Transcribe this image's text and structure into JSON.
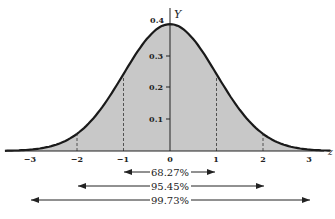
{
  "chart_data": {
    "type": "area",
    "title": "",
    "xlabel": "z",
    "ylabel": "Y",
    "xlim": [
      -3.3,
      3.3
    ],
    "ylim": [
      0,
      0.4
    ],
    "grid": false,
    "x_ticks": [
      "-3",
      "-2",
      "-1",
      "0",
      "1",
      "2",
      "3"
    ],
    "y_ticks": [
      "0.1",
      "0.2",
      "0.3",
      "0.4"
    ],
    "curve": "standard normal density Y = (1/sqrt(2*pi)) * exp(-z^2/2)",
    "series": [
      {
        "name": "Standard normal curve",
        "x": [
          -3,
          -2,
          -1,
          0,
          1,
          2,
          3
        ],
        "values": [
          0.0044,
          0.054,
          0.242,
          0.399,
          0.242,
          0.054,
          0.0044
        ]
      }
    ],
    "dashed_lines_at": [
      -2,
      -1,
      1,
      2
    ],
    "annotations": [
      {
        "label": "68.27%",
        "from": -1,
        "to": 1
      },
      {
        "label": "95.45%",
        "from": -2,
        "to": 2
      },
      {
        "label": "99.73%",
        "from": -3,
        "to": 3
      }
    ]
  },
  "labels": {
    "y_axis": "Y",
    "x_axis": "z",
    "xt": [
      "−3",
      "−2",
      "−1",
      "0",
      "1",
      "2",
      "3"
    ],
    "yt": [
      "0.1",
      "0.2",
      "0.3",
      "0.4"
    ],
    "p68": "68.27%",
    "p95": "95.45%",
    "p99": "99.73%"
  },
  "colors": {
    "fill": "#c8c8c8",
    "curve": "#1a1a1a"
  }
}
